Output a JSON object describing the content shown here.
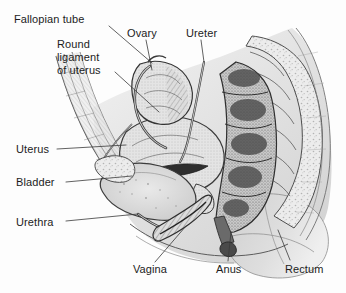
{
  "figure": {
    "illustration_type": "anatomical-line-drawing",
    "style": "grayscale pen-and-ink cross-section",
    "background_color": "#fdfdfd",
    "ink_color": "#2b2b2b",
    "tissue_fill": "#d8d8d8",
    "leader_color": "#3a3a3a"
  },
  "labels": [
    {
      "id": "fallopian-tube",
      "text": "Fallopian tube",
      "x": 14,
      "y": 13,
      "leader": "M 109 26 L 152 63"
    },
    {
      "id": "round-ligament-of-uterus",
      "text": "Round\nligament\nof uterus",
      "x": 57,
      "y": 38,
      "leader": "M 115 72 L 159 112"
    },
    {
      "id": "ovary",
      "text": "Ovary",
      "x": 127,
      "y": 27,
      "leader": "M 146 40 L 152 70"
    },
    {
      "id": "ureter",
      "text": "Ureter",
      "x": 186,
      "y": 27,
      "leader": "M 201 40 L 204 62"
    },
    {
      "id": "uterus",
      "text": "Uterus",
      "x": 16,
      "y": 143,
      "leader": "M 57 149 L 126 145"
    },
    {
      "id": "bladder",
      "text": "Bladder",
      "x": 16,
      "y": 176,
      "leader": "M 66 182 L 132 176"
    },
    {
      "id": "urethra",
      "text": "Urethra",
      "x": 16,
      "y": 216,
      "leader": "M 66 221 L 138 214"
    },
    {
      "id": "vagina",
      "text": "Vagina",
      "x": 133,
      "y": 263,
      "leader": "M 155 262 L 186 226"
    },
    {
      "id": "anus",
      "text": "Anus",
      "x": 216,
      "y": 263,
      "leader": "M 228 261 L 231 232"
    },
    {
      "id": "rectum",
      "text": "Rectum",
      "x": 285,
      "y": 263,
      "leader": "M 290 260 L 278 230"
    }
  ],
  "structures": [
    "abdominal wall",
    "uterus",
    "ovary",
    "fallopian tube",
    "round ligament of uterus",
    "ureter",
    "bladder",
    "urethra",
    "vagina",
    "rectum",
    "anus",
    "sacrum",
    "pubic bone",
    "buttock"
  ]
}
